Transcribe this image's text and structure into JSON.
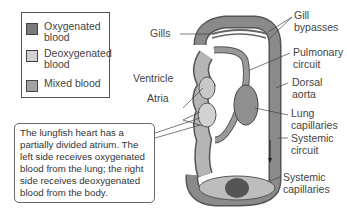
{
  "legend": {
    "items": [
      {
        "label": "Oxygenated\nblood",
        "color": "#7a7a7a"
      },
      {
        "label": "Deoxygenated\nblood",
        "color": "#d2d2d2"
      },
      {
        "label": "Mixed blood",
        "color": "#a3a3a3"
      }
    ]
  },
  "labels": {
    "gills": "Gills",
    "gill_bypasses": "Gill\nbypasses",
    "pulmonary_circuit": "Pulmonary\ncircuit",
    "dorsal_aorta": "Dorsal\naorta",
    "ventricle": "Ventricle",
    "atria": "Atria",
    "lung_capillaries": "Lung\ncapillaries",
    "systemic_circuit": "Systemic\ncircuit",
    "systemic_capillaries": "Systemic\ncapillaries"
  },
  "callout": {
    "text": "The lungfish heart has a partially divided atrium. The left side receives oxygenated blood from the lung; the right side receives deoxygenated blood from the body."
  },
  "colors": {
    "oxygenated": "#7a7a7a",
    "deoxygenated": "#d2d2d2",
    "mixed": "#a3a3a3",
    "outline": "#555555"
  }
}
